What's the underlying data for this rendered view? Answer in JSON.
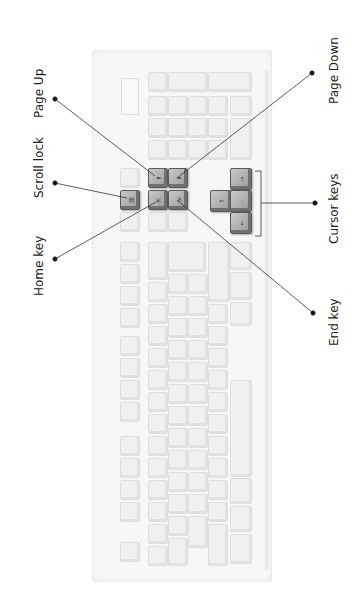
{
  "diagram": {
    "title": "",
    "orientation": "rotated 90° counter-clockwise",
    "labels": [
      {
        "id": "page-up",
        "text": "Page Up"
      },
      {
        "id": "scroll-lock",
        "text": "Scroll lock"
      },
      {
        "id": "home-key",
        "text": "Home key"
      },
      {
        "id": "page-down",
        "text": "Page Down"
      },
      {
        "id": "cursor-keys",
        "text": "Cursor keys"
      },
      {
        "id": "end-key",
        "text": "End key"
      }
    ],
    "highlighted_keys": {
      "scroll_lock": "Scroll lock",
      "page_up": "Page Up",
      "page_down": "Page Down",
      "home": "Home",
      "end": "End",
      "arrow_up": "↑",
      "arrow_left": "←",
      "arrow_down": "↓",
      "arrow_right": "→"
    },
    "colors": {
      "label_text": "#222222",
      "leader_line": "#333333",
      "highlight_key": "#9a9a9a",
      "faded_key": "#f0f0f0",
      "keyboard_body": "#f7f7f7"
    }
  }
}
